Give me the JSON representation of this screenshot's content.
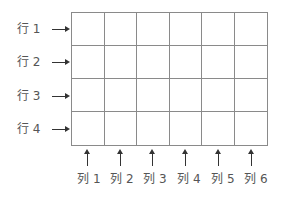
{
  "rows": [
    {
      "label": "行 1"
    },
    {
      "label": "行 2"
    },
    {
      "label": "行 3"
    },
    {
      "label": "行 4"
    }
  ],
  "columns": [
    {
      "label": "列 1"
    },
    {
      "label": "列 2"
    },
    {
      "label": "列 3"
    },
    {
      "label": "列 4"
    },
    {
      "label": "列 5"
    },
    {
      "label": "列 6"
    }
  ],
  "colors": {
    "grid_line": "#8a8a8a",
    "arrow": "#333333",
    "text": "#555555"
  }
}
